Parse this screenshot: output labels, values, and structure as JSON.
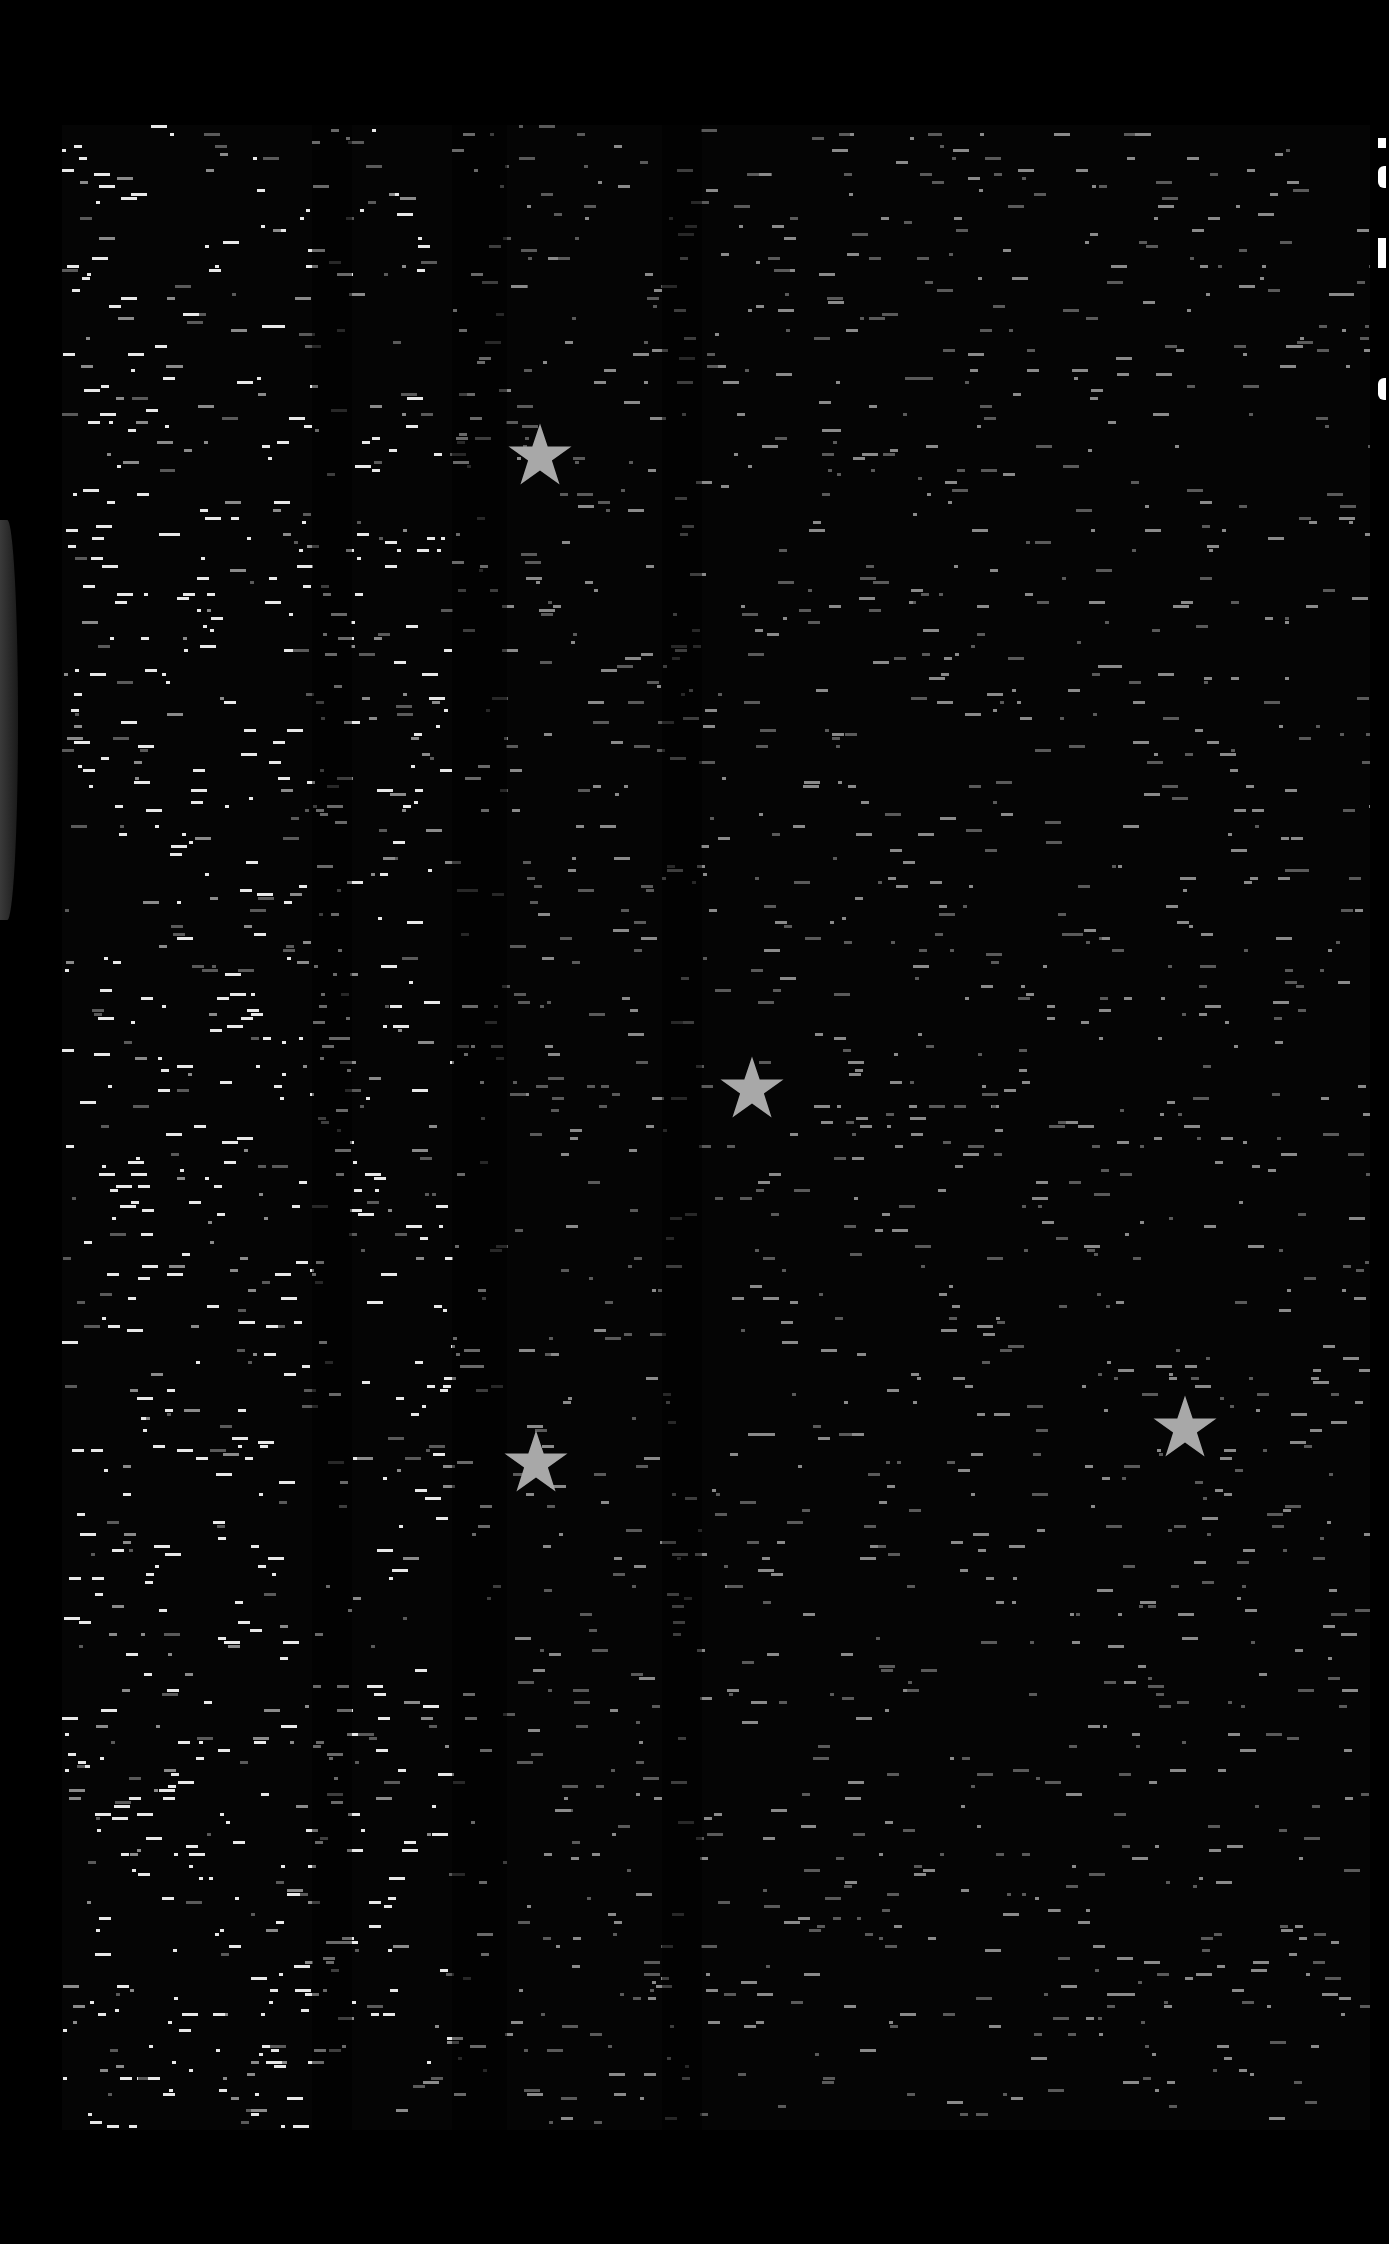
{
  "image": {
    "description": "Dark dot-matrix / noise texture panel with scattered grey star markers",
    "background_color": "#000000",
    "texture_light_color": "#e8e8e8",
    "texture_mid_color": "#8a8a8a",
    "star_color": "#a8a8a8"
  },
  "stars": [
    {
      "x": 540,
      "y": 455
    },
    {
      "x": 752,
      "y": 1088
    },
    {
      "x": 536,
      "y": 1462
    },
    {
      "x": 1185,
      "y": 1427
    }
  ]
}
